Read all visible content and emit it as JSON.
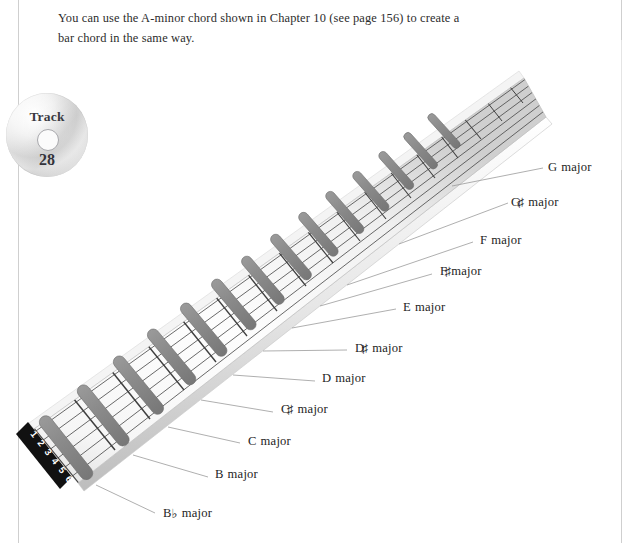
{
  "page": {
    "body_text": "You can use the A-minor chord shown in Chapter 10 (see page 156) to create a bar chord in the same way.",
    "rule_color": "#cfcfcf",
    "background": "#ffffff"
  },
  "track_badge": {
    "icon": "cd-disc-icon",
    "label": "Track",
    "number": "28"
  },
  "diagram": {
    "name": "guitar-neck-bar-chord-diagram",
    "fret_marker_color": "#8d8d8d",
    "fretboard_color": "#f3f3f3",
    "fret_line_color": "#4a4a4a",
    "nut_color": "#111111",
    "leader_line_color": "#9a9a9a",
    "string_numbers": [
      "1",
      "2",
      "3",
      "4",
      "5",
      "6"
    ],
    "chords": [
      {
        "root": "B",
        "accidental": "♭",
        "quality": "major",
        "label": "B♭ major"
      },
      {
        "root": "B",
        "accidental": "",
        "quality": "major",
        "label": "B major"
      },
      {
        "root": "C",
        "accidental": "",
        "quality": "major",
        "label": "C major"
      },
      {
        "root": "C",
        "accidental": "♯",
        "quality": "major",
        "label": "C♯ major"
      },
      {
        "root": "D",
        "accidental": "",
        "quality": "major",
        "label": "D major"
      },
      {
        "root": "D",
        "accidental": "♯",
        "quality": "major",
        "label": "D♯ major"
      },
      {
        "root": "E",
        "accidental": "",
        "quality": "major",
        "label": "E major"
      },
      {
        "root": "F",
        "accidental": "",
        "quality": "major",
        "label": "F major"
      },
      {
        "root": "F",
        "accidental": "♯",
        "quality": "major",
        "label": "F♯ major"
      },
      {
        "root": "G",
        "accidental": "",
        "quality": "major",
        "label": "G major"
      },
      {
        "root": "G",
        "accidental": "♯",
        "quality": "major",
        "label": "G♯ major"
      }
    ]
  },
  "labels": {
    "bb_major": "B♭ major",
    "b_major": "B major",
    "c_major": "C major",
    "cs_major": "C♯ major",
    "d_major": "D major",
    "ds_major": "D♯ major",
    "e_major": "E major",
    "f_major": "F major",
    "fs_major": "F♯ major",
    "g_major": "G major",
    "gs_major": "G♯ major",
    "major_word": "major",
    "root_bb": "B",
    "root_b": "B",
    "root_c": "C",
    "root_cs": "C",
    "root_d": "D",
    "root_ds": "D",
    "root_e": "E",
    "root_f": "F",
    "root_fs": "F",
    "root_g": "G",
    "root_gs": "G",
    "flat_sign": "♭",
    "sharp_sign": "♯"
  }
}
